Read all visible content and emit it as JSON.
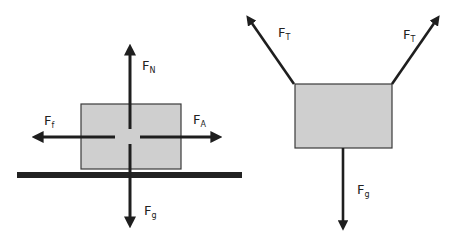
{
  "colors": {
    "ink": "#1e1e1e",
    "box_fill": "#cfcfcf",
    "box_stroke": "#3a3a3a",
    "ground": "#222222",
    "background": "#ffffff"
  },
  "diagram_left": {
    "title": "Block on a surface",
    "object": "block",
    "surface": "ground",
    "forces": [
      {
        "id": "normal",
        "symbol": "F",
        "subscript": "N",
        "direction": "up"
      },
      {
        "id": "gravity",
        "symbol": "F",
        "subscript": "g",
        "direction": "down"
      },
      {
        "id": "friction",
        "symbol": "F",
        "subscript": "f",
        "direction": "left"
      },
      {
        "id": "applied",
        "symbol": "F",
        "subscript": "A",
        "direction": "right"
      }
    ]
  },
  "diagram_right": {
    "title": "Block hanging from two cables",
    "object": "block",
    "forces": [
      {
        "id": "tension-left",
        "symbol": "F",
        "subscript": "T",
        "direction": "up-left"
      },
      {
        "id": "tension-right",
        "symbol": "F",
        "subscript": "T",
        "direction": "up-right"
      },
      {
        "id": "gravity",
        "symbol": "F",
        "subscript": "g",
        "direction": "down"
      }
    ]
  }
}
